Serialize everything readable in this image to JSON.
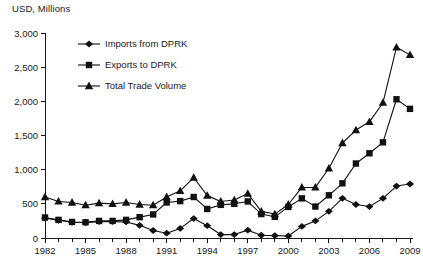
{
  "chart_data": {
    "type": "line",
    "title": "",
    "ylabel": "USD, Millions",
    "xlabel": "",
    "ylim": [
      0,
      3000
    ],
    "xlim": [
      1982,
      2009
    ],
    "grid": false,
    "legend_position": "top-left-inside",
    "y_ticks": [
      0,
      500,
      1000,
      1500,
      2000,
      2500,
      3000
    ],
    "y_tick_labels": [
      "0",
      "500",
      "1,000",
      "1,500",
      "2,000",
      "2,500",
      "3,000"
    ],
    "x": [
      1982,
      1983,
      1984,
      1985,
      1986,
      1987,
      1988,
      1989,
      1990,
      1991,
      1992,
      1993,
      1994,
      1995,
      1996,
      1997,
      1998,
      1999,
      2000,
      2001,
      2002,
      2003,
      2004,
      2005,
      2006,
      2007,
      2008,
      2009
    ],
    "x_tick_labels": [
      "1982",
      "1985",
      "1988",
      "1991",
      "1994",
      "1997",
      "2000",
      "2003",
      "2006",
      "2009"
    ],
    "x_labeled_years": [
      1982,
      1985,
      1988,
      1991,
      1994,
      1997,
      2000,
      2003,
      2006,
      2009
    ],
    "series": [
      {
        "name": "Imports from DPRK",
        "marker": "diamond",
        "values": [
          290,
          260,
          230,
          225,
          240,
          240,
          235,
          185,
          110,
          70,
          140,
          285,
          180,
          50,
          50,
          115,
          40,
          35,
          30,
          170,
          250,
          390,
          580,
          490,
          460,
          580,
          760,
          790
        ]
      },
      {
        "name": "Exports to DPRK",
        "marker": "square",
        "values": [
          300,
          265,
          235,
          230,
          250,
          250,
          265,
          305,
          345,
          520,
          540,
          600,
          425,
          485,
          500,
          535,
          350,
          310,
          455,
          580,
          460,
          625,
          800,
          1090,
          1240,
          1400,
          2030,
          1890
        ]
      },
      {
        "name": "Total Trade Volume",
        "marker": "triangle",
        "values": [
          600,
          535,
          520,
          480,
          510,
          500,
          520,
          490,
          480,
          600,
          690,
          885,
          620,
          535,
          555,
          650,
          390,
          350,
          490,
          740,
          740,
          1020,
          1390,
          1580,
          1700,
          1980,
          2790,
          2680
        ]
      }
    ]
  },
  "legend": {
    "items": [
      {
        "label": "Imports from DPRK",
        "marker": "diamond"
      },
      {
        "label": "Exports to DPRK",
        "marker": "square"
      },
      {
        "label": "Total Trade Volume",
        "marker": "triangle"
      }
    ]
  }
}
